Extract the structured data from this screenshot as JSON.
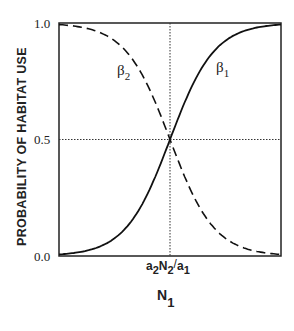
{
  "chart_data": {
    "type": "line",
    "title": "",
    "xlabel": "N",
    "xlabel_sub": "1",
    "ylabel": "PROBABILITY OF HABITAT USE",
    "ylim": [
      0.0,
      1.0
    ],
    "yticks": [
      "0.0",
      "0.5",
      "1.0"
    ],
    "xticks": [
      {
        "label": "a2N2/a1",
        "position": 0.5
      }
    ],
    "xtick_parts": {
      "a": "a",
      "s2": "2",
      "N": "N",
      "s2b": "2",
      "slash": "/",
      "a2": "a",
      "s1": "1"
    },
    "reference_lines": [
      {
        "type": "horizontal",
        "y": 0.5,
        "style": "dotted"
      },
      {
        "type": "vertical",
        "x": 0.5,
        "style": "dotted"
      }
    ],
    "series": [
      {
        "name": "β1",
        "label": "β",
        "sub": "1",
        "style": "solid",
        "shape": "increasing sigmoid",
        "x": [
          0,
          0.1,
          0.2,
          0.3,
          0.4,
          0.5,
          0.6,
          0.7,
          0.8,
          0.9,
          1.0
        ],
        "values": [
          0.01,
          0.03,
          0.07,
          0.15,
          0.3,
          0.5,
          0.7,
          0.85,
          0.93,
          0.97,
          0.99
        ]
      },
      {
        "name": "β2",
        "label": "β",
        "sub": "2",
        "style": "dashed",
        "shape": "decreasing sigmoid",
        "x": [
          0,
          0.1,
          0.2,
          0.3,
          0.4,
          0.5,
          0.6,
          0.7,
          0.8,
          0.9,
          1.0
        ],
        "values": [
          0.99,
          0.97,
          0.93,
          0.85,
          0.7,
          0.5,
          0.3,
          0.15,
          0.07,
          0.03,
          0.01
        ]
      }
    ],
    "grid": false,
    "legend": "inline labels"
  }
}
